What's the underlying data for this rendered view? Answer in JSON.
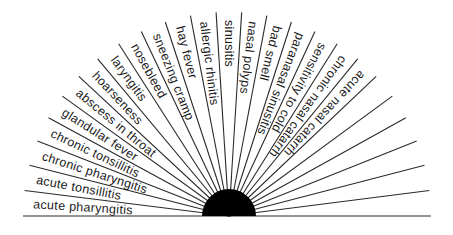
{
  "diagram": {
    "type": "radial-fan",
    "total_sectors": 25,
    "labels": [
      "acute pharyngitis",
      "acute tonsillitis",
      "chronic pharyngitis",
      "chronic tonsillitis",
      "glandular fever",
      "abscess in throat",
      "hoarseness",
      "laryngitis",
      "nosebleed",
      "sneezing cramp",
      "hay fever",
      "allergic rhinitis",
      "sinusitis",
      "nasal polyps",
      "bad smell",
      "paranasal sinusitis",
      "sensitivity to cold",
      "chronic nasal catarrh",
      "acute nasal catarrh",
      "",
      "",
      "",
      "",
      "",
      ""
    ],
    "colors": {
      "lines": "#2a2a2a",
      "hub": "#000000",
      "text": "#1a1a1a",
      "background": "#ffffff"
    }
  }
}
